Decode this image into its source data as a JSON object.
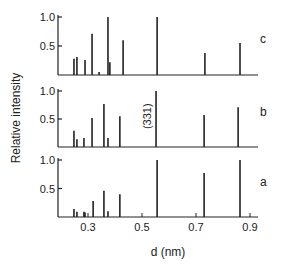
{
  "chart_data": {
    "type": "bar",
    "subtype": "stick-spectrum",
    "title": "",
    "xlabel": "d (nm)",
    "ylabel": "Relative intensity",
    "xlim": [
      0.2,
      0.92
    ],
    "ylim": [
      0,
      1.0
    ],
    "x_ticks": [
      0.3,
      0.5,
      0.7,
      0.9
    ],
    "x_tick_labels": [
      "0.3",
      "0.5",
      "0.7",
      "0.9"
    ],
    "y_ticks": [
      0.5,
      1.0
    ],
    "y_tick_labels": [
      "0.5",
      "1.0"
    ],
    "grid": false,
    "legend": null,
    "panels": [
      {
        "label": "c",
        "x": [
          0.248,
          0.259,
          0.289,
          0.315,
          0.341,
          0.374,
          0.381,
          0.43,
          0.556,
          0.733,
          0.863
        ],
        "values": [
          0.28,
          0.31,
          0.26,
          0.71,
          0.05,
          1.0,
          0.22,
          0.6,
          1.0,
          0.38,
          0.55
        ]
      },
      {
        "label": "b",
        "annotation": "(331)",
        "annotation_x": 0.552,
        "x": [
          0.248,
          0.259,
          0.285,
          0.315,
          0.359,
          0.374,
          0.418,
          0.552,
          0.73,
          0.856
        ],
        "values": [
          0.29,
          0.14,
          0.16,
          0.52,
          0.77,
          0.16,
          0.55,
          1.0,
          0.57,
          0.71
        ]
      },
      {
        "label": "a",
        "x": [
          0.248,
          0.259,
          0.285,
          0.289,
          0.319,
          0.359,
          0.374,
          0.418,
          0.556,
          0.73,
          0.863
        ],
        "values": [
          0.14,
          0.09,
          0.09,
          0.08,
          0.28,
          0.46,
          0.1,
          0.4,
          1.0,
          0.77,
          1.0
        ]
      }
    ]
  }
}
